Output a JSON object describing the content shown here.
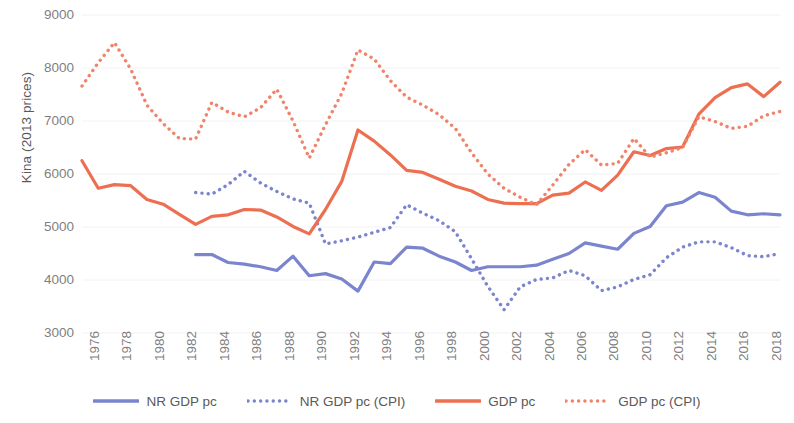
{
  "chart_data": {
    "type": "line",
    "title": "",
    "xlabel": "",
    "ylabel": "Kina (2013 prices)",
    "ylim": [
      3000,
      9000
    ],
    "yticks": [
      9000,
      8000,
      7000,
      6000,
      5000,
      4000,
      3000
    ],
    "xlim": [
      1976,
      2019
    ],
    "xticks": [
      1976,
      1978,
      1980,
      1982,
      1984,
      1986,
      1988,
      1990,
      1992,
      1994,
      1996,
      1998,
      2000,
      2002,
      2004,
      2006,
      2008,
      2010,
      2012,
      2014,
      2016,
      2018
    ],
    "grid": "horizontal-light",
    "legend_position": "bottom",
    "x": [
      1976,
      1977,
      1978,
      1979,
      1980,
      1981,
      1982,
      1983,
      1984,
      1985,
      1986,
      1987,
      1988,
      1989,
      1990,
      1991,
      1992,
      1993,
      1994,
      1995,
      1996,
      1997,
      1998,
      1999,
      2000,
      2001,
      2002,
      2003,
      2004,
      2005,
      2006,
      2007,
      2008,
      2009,
      2010,
      2011,
      2012,
      2013,
      2014,
      2015,
      2016,
      2017,
      2018,
      2019
    ],
    "series": [
      {
        "name": "NR GDP pc",
        "color": "#7B85CE",
        "style": "solid",
        "x": [
          1983,
          1984,
          1985,
          1986,
          1987,
          1988,
          1989,
          1990,
          1991,
          1992,
          1993,
          1994,
          1995,
          1996,
          1997,
          1998,
          1999,
          2000,
          2001,
          2002,
          2003,
          2004,
          2005,
          2006,
          2007,
          2008,
          2009,
          2010,
          2011,
          2012,
          2013,
          2014,
          2015,
          2016,
          2017,
          2018,
          2019
        ],
        "values": [
          4480,
          4480,
          4330,
          4300,
          4250,
          4180,
          4450,
          4080,
          4120,
          4020,
          3790,
          4340,
          4310,
          4620,
          4600,
          4450,
          4340,
          4180,
          4250,
          4250,
          4250,
          4280,
          4390,
          4500,
          4700,
          4640,
          4580,
          4880,
          5010,
          5400,
          5470,
          5650,
          5560,
          5300,
          5230,
          5250,
          5230
        ]
      },
      {
        "name": "NR GDP pc (CPI)",
        "color": "#7B85CE",
        "style": "dotted",
        "x": [
          1983,
          1984,
          1985,
          1986,
          1987,
          1988,
          1989,
          1990,
          1991,
          1992,
          1993,
          1994,
          1995,
          1996,
          1997,
          1998,
          1999,
          2000,
          2001,
          2002,
          2003,
          2004,
          2005,
          2006,
          2007,
          2008,
          2009,
          2010,
          2011,
          2012,
          2013,
          2014,
          2015,
          2016,
          2017,
          2018,
          2019
        ],
        "values": [
          5650,
          5620,
          5800,
          6050,
          5830,
          5670,
          5530,
          5450,
          4680,
          4740,
          4810,
          4900,
          4990,
          5420,
          5260,
          5120,
          4910,
          4400,
          3880,
          3440,
          3870,
          4010,
          4040,
          4180,
          4080,
          3800,
          3870,
          4010,
          4100,
          4420,
          4620,
          4720,
          4720,
          4610,
          4460,
          4440,
          4500
        ]
      },
      {
        "name": "GDP pc",
        "color": "#ED6F52",
        "style": "solid",
        "x": [
          1976,
          1977,
          1978,
          1979,
          1980,
          1981,
          1982,
          1983,
          1984,
          1985,
          1986,
          1987,
          1988,
          1989,
          1990,
          1991,
          1992,
          1993,
          1994,
          1995,
          1996,
          1997,
          1998,
          1999,
          2000,
          2001,
          2002,
          2003,
          2004,
          2005,
          2006,
          2007,
          2008,
          2009,
          2010,
          2011,
          2012,
          2013,
          2014,
          2015,
          2016,
          2017,
          2018,
          2019
        ],
        "values": [
          6250,
          5730,
          5800,
          5780,
          5520,
          5430,
          5240,
          5050,
          5200,
          5230,
          5330,
          5320,
          5190,
          5010,
          4870,
          5330,
          5860,
          6830,
          6620,
          6360,
          6070,
          6030,
          5900,
          5770,
          5680,
          5520,
          5450,
          5440,
          5440,
          5600,
          5640,
          5850,
          5690,
          5980,
          6420,
          6350,
          6480,
          6510,
          7130,
          7440,
          7630,
          7700,
          7460,
          7730
        ]
      },
      {
        "name": "GDP pc (CPI)",
        "color": "#F0846B",
        "style": "dotted",
        "x": [
          1976,
          1977,
          1978,
          1979,
          1980,
          1981,
          1982,
          1983,
          1984,
          1985,
          1986,
          1987,
          1988,
          1989,
          1990,
          1991,
          1992,
          1993,
          1994,
          1995,
          1996,
          1997,
          1998,
          1999,
          2000,
          2001,
          2002,
          2003,
          2004,
          2005,
          2006,
          2007,
          2008,
          2009,
          2010,
          2011,
          2012,
          2013,
          2014,
          2015,
          2016,
          2017,
          2018,
          2019
        ],
        "values": [
          7660,
          8100,
          8480,
          7980,
          7300,
          6950,
          6670,
          6660,
          7350,
          7170,
          7080,
          7250,
          7600,
          7000,
          6300,
          6930,
          7520,
          8340,
          8170,
          7760,
          7450,
          7300,
          7120,
          6860,
          6400,
          6000,
          5730,
          5560,
          5420,
          5790,
          6180,
          6460,
          6170,
          6200,
          6670,
          6320,
          6400,
          6500,
          7080,
          6990,
          6860,
          6900,
          7100,
          7180
        ]
      }
    ]
  },
  "axes": {
    "y_title": "Kina (2013 prices)",
    "y_labels": [
      "9000",
      "8000",
      "7000",
      "6000",
      "5000",
      "4000",
      "3000"
    ],
    "x_labels": [
      "1976",
      "1978",
      "1980",
      "1982",
      "1984",
      "1986",
      "1988",
      "1990",
      "1992",
      "1994",
      "1996",
      "1998",
      "2000",
      "2002",
      "2004",
      "2006",
      "2008",
      "2010",
      "2012",
      "2014",
      "2016",
      "2018"
    ]
  },
  "legend": {
    "items": [
      {
        "label": "NR GDP pc",
        "color": "#7B85CE",
        "style": "solid"
      },
      {
        "label": "NR GDP pc (CPI)",
        "color": "#7B85CE",
        "style": "dotted"
      },
      {
        "label": "GDP pc",
        "color": "#ED6F52",
        "style": "solid"
      },
      {
        "label": "GDP pc (CPI)",
        "color": "#F0846B",
        "style": "dotted"
      }
    ]
  }
}
